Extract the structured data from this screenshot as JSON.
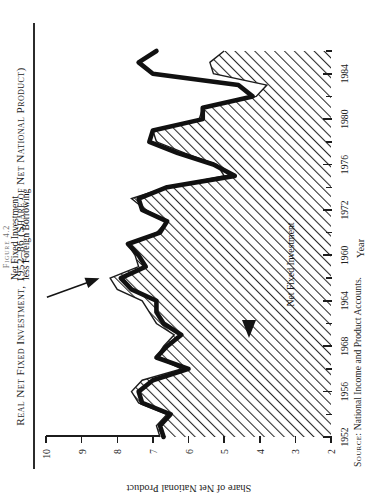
{
  "figure": {
    "number": "Figure 4.2",
    "title": "Real Net Fixed Investment, 1952–86 (Share of Net National Product)",
    "source_prefix": "Source:",
    "source_text": "National Income and Product Accounts.",
    "rotation_degrees": -90
  },
  "axes": {
    "x": {
      "title": "Year",
      "tick_labels": [
        "1952",
        "1956",
        "1968",
        "1964",
        "1960",
        "1972",
        "1976",
        "1980",
        "1984"
      ],
      "tick_values": [
        1952,
        1956,
        1960,
        1964,
        1968,
        1972,
        1976,
        1980,
        1984
      ],
      "minor_every": 2,
      "range": [
        1952,
        1986
      ]
    },
    "y": {
      "title": "Share of Net National Product",
      "tick_labels": [
        "2",
        "3",
        "4",
        "5",
        "6",
        "7",
        "8",
        "9",
        "10"
      ],
      "range": [
        2,
        10
      ]
    }
  },
  "annotations": [
    {
      "name": "series-label-less-foreign-borrowing",
      "line1": "Net Fixed Investment",
      "line2": "less Foreign Borrowing"
    },
    {
      "name": "series-label-net-fixed-investment",
      "line1": "Net Fixed Investment"
    }
  ],
  "colors": {
    "ink": "#1c1c1c",
    "hatch": "#2a2a2a",
    "paper": "#ffffff",
    "thick_line": "#111111"
  },
  "chart_data": {
    "type": "area",
    "title": "Real Net Fixed Investment, 1952–86 (Share of Net National Product)",
    "xlabel": "Year",
    "ylabel": "Share of Net National Product",
    "xlim": [
      1952,
      1986
    ],
    "ylim": [
      2,
      10
    ],
    "grid": false,
    "legend": "annotated in plot",
    "x": [
      1952,
      1953,
      1954,
      1955,
      1956,
      1957,
      1958,
      1959,
      1960,
      1961,
      1962,
      1963,
      1964,
      1965,
      1966,
      1967,
      1968,
      1969,
      1970,
      1971,
      1972,
      1973,
      1974,
      1975,
      1976,
      1977,
      1978,
      1979,
      1980,
      1981,
      1982,
      1983,
      1984,
      1985,
      1986
    ],
    "series": [
      {
        "name": "Net Fixed Investment",
        "style": "hatched-area-with-outline",
        "values": [
          6.8,
          6.9,
          6.6,
          7.4,
          7.6,
          7.3,
          6.2,
          6.9,
          6.7,
          6.4,
          6.9,
          7.1,
          7.3,
          8.0,
          8.2,
          7.4,
          7.5,
          7.7,
          6.9,
          6.6,
          7.2,
          7.6,
          6.6,
          5.0,
          5.2,
          6.1,
          6.9,
          7.0,
          5.7,
          5.6,
          4.1,
          3.8,
          5.3,
          5.4,
          5.0
        ]
      },
      {
        "name": "Net Fixed Investment less Foreign Borrowing",
        "style": "thick-line",
        "values": [
          6.7,
          6.8,
          6.5,
          7.3,
          7.4,
          7.0,
          6.0,
          6.9,
          6.6,
          6.2,
          6.7,
          6.9,
          6.9,
          7.6,
          7.9,
          7.2,
          7.4,
          7.7,
          6.8,
          6.6,
          7.3,
          7.4,
          6.6,
          4.7,
          5.3,
          6.3,
          7.1,
          7.0,
          5.6,
          5.6,
          4.2,
          4.6,
          7.0,
          7.4,
          6.9
        ]
      }
    ]
  }
}
